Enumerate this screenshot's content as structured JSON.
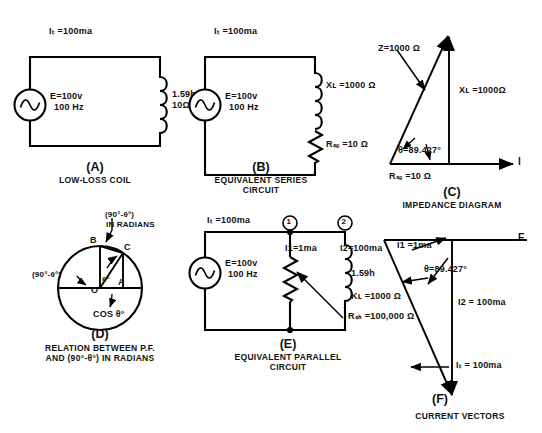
{
  "figure": {
    "ohm": "Ω",
    "theta": "θ"
  },
  "panel_a": {
    "current_label": "Iₜ =100ma",
    "source_line1": "E=100v",
    "source_line2": "100 Hz",
    "coil_line1": "1.59h",
    "coil_line2": "10Ω",
    "caption_letter": "(A)",
    "caption_text": "LOW-LOSS COIL"
  },
  "panel_b": {
    "current_label": "Iₜ =100ma",
    "source_line1": "E=100v",
    "source_line2": "100 Hz",
    "reactance_label": "Xʟ =1000 Ω",
    "resistance_label": "Rₛₑ =10 Ω",
    "caption_letter": "(B)",
    "caption_text_line1": "EQUIVALENT SERIES",
    "caption_text_line2": "CIRCUIT"
  },
  "panel_c": {
    "z_label": "Z=1000 Ω",
    "xl_label": "Xʟ =1000Ω",
    "r_label": "Rₛₑ =10 Ω",
    "theta_label": "θ=89.427°",
    "axis_label": "I",
    "caption_letter": "(C)",
    "caption_text": "IMPEDANCE DIAGRAM"
  },
  "panel_d": {
    "top_label_line1": "(90°-θ°)",
    "top_label_line2": "IN RADIANS",
    "arc_label": "(90°-θ°)",
    "point_b": "B",
    "point_c": "C",
    "point_a": "A",
    "point_o": "O",
    "theta_label": "θ°",
    "cos_label": "COS θ°",
    "caption_letter": "(D)",
    "caption_text_line1": "RELATION BETWEEN P.F.",
    "caption_text_line2": "AND (90°-θ°) IN RADIANS"
  },
  "panel_e": {
    "current_label": "Iₜ =100ma",
    "node1": "1",
    "node2": "2",
    "branch1_label": "I1=1ma",
    "branch2_label": "I2=100ma",
    "inductance_label": "1.59h",
    "kl_label": "Kʟ =1000 Ω",
    "rsh_label": "Rₛₕ =100,000 Ω",
    "source_line1": "E=100v",
    "source_line2": "100 Hz",
    "caption_letter": "(E)",
    "caption_text_line1": "EQUIVALENT PARALLEL",
    "caption_text_line2": "CIRCUIT"
  },
  "panel_f": {
    "e_axis_label": "E",
    "i1_label": "I1 =1ma",
    "theta_label": "θ=89.427°",
    "i2_label": "I2 = 100ma",
    "it_label": "Iₜ = 100ma",
    "caption_letter": "(F)",
    "caption_text": "CURRENT VECTORS"
  },
  "colors": {
    "ink": "#000000",
    "paper": "#ffffff"
  }
}
